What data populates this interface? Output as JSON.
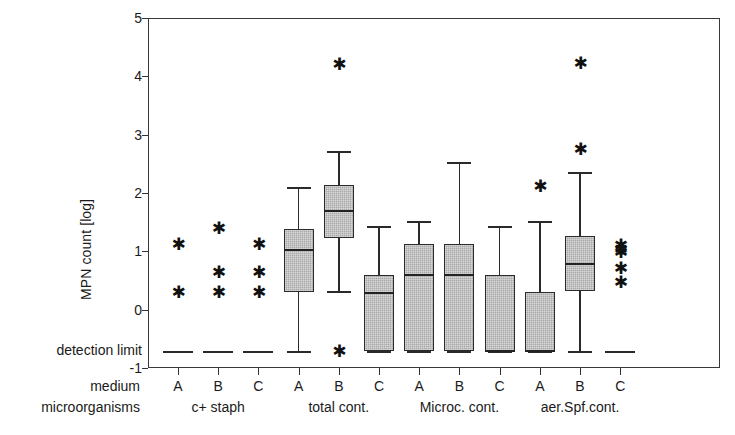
{
  "chart_data": {
    "type": "box",
    "title": "",
    "xlabel": "",
    "ylabel": "MPN count [log]",
    "ylim": [
      -1,
      5
    ],
    "yticks": [
      -1,
      0,
      1,
      2,
      3,
      4,
      5
    ],
    "ytick_labels": [
      "-1",
      "0",
      "1",
      "2",
      "3",
      "4",
      "5"
    ],
    "grid": false,
    "legend": "none",
    "detection_limit": {
      "label": "detection limit",
      "value": -0.71
    },
    "axis_row_labels": {
      "medium": "medium",
      "microorganisms": "microorganisms"
    },
    "groups": [
      {
        "label": "c+ staph",
        "media": [
          "A",
          "B",
          "C"
        ]
      },
      {
        "label": "total cont.",
        "media": [
          "A",
          "B",
          "C"
        ]
      },
      {
        "label": "Microc. cont.",
        "media": [
          "A",
          "B",
          "C"
        ]
      },
      {
        "label": "aer.Spf.cont.",
        "media": [
          "A",
          "B",
          "C"
        ]
      }
    ],
    "categories": [
      "c+ staph A",
      "c+ staph B",
      "c+ staph C",
      "total cont. A",
      "total cont. B",
      "total cont. C",
      "Microc. cont. A",
      "Microc. cont. B",
      "Microc. cont. C",
      "aer.Spf.cont. A",
      "aer.Spf.cont. B",
      "aer.Spf.cont. C"
    ],
    "boxes": [
      {
        "category": "c+ staph A",
        "group": "c+ staph",
        "medium": "A",
        "q1": -0.71,
        "median": -0.71,
        "q3": -0.71,
        "whisker_low": -0.71,
        "whisker_high": -0.71,
        "at_detection_limit": true,
        "outliers": [
          1.12,
          0.3
        ]
      },
      {
        "category": "c+ staph B",
        "group": "c+ staph",
        "medium": "B",
        "q1": -0.71,
        "median": -0.71,
        "q3": -0.71,
        "whisker_low": -0.71,
        "whisker_high": -0.71,
        "at_detection_limit": true,
        "outliers": [
          1.39,
          0.63,
          0.29
        ]
      },
      {
        "category": "c+ staph C",
        "group": "c+ staph",
        "medium": "C",
        "q1": -0.71,
        "median": -0.71,
        "q3": -0.71,
        "whisker_low": -0.71,
        "whisker_high": -0.71,
        "at_detection_limit": true,
        "outliers": [
          1.12,
          0.63,
          0.29
        ]
      },
      {
        "category": "total cont. A",
        "group": "total cont.",
        "medium": "A",
        "q1": 0.31,
        "median": 1.03,
        "q3": 1.38,
        "whisker_low": -0.71,
        "whisker_high": 2.1,
        "at_detection_limit": false,
        "outliers": []
      },
      {
        "category": "total cont. B",
        "group": "total cont.",
        "medium": "B",
        "q1": 1.23,
        "median": 1.7,
        "q3": 2.13,
        "whisker_low": 0.32,
        "whisker_high": 2.72,
        "at_detection_limit": false,
        "outliers": [
          4.21,
          -0.71
        ]
      },
      {
        "category": "total cont. C",
        "group": "total cont.",
        "medium": "C",
        "q1": -0.71,
        "median": 0.28,
        "q3": 0.6,
        "whisker_low": -0.71,
        "whisker_high": 1.43,
        "at_detection_limit": false,
        "outliers": []
      },
      {
        "category": "Microc. cont. A",
        "group": "Microc. cont.",
        "medium": "A",
        "q1": -0.71,
        "median": 0.6,
        "q3": 1.12,
        "whisker_low": -0.71,
        "whisker_high": 1.52,
        "at_detection_limit": false,
        "outliers": []
      },
      {
        "category": "Microc. cont. B",
        "group": "Microc. cont.",
        "medium": "B",
        "q1": -0.71,
        "median": 0.6,
        "q3": 1.12,
        "whisker_low": -0.71,
        "whisker_high": 2.53,
        "at_detection_limit": false,
        "outliers": []
      },
      {
        "category": "Microc. cont. C",
        "group": "Microc. cont.",
        "medium": "C",
        "q1": -0.71,
        "median": -0.71,
        "q3": 0.6,
        "whisker_low": -0.71,
        "whisker_high": 1.43,
        "at_detection_limit": false,
        "outliers": []
      },
      {
        "category": "aer.Spf.cont. A",
        "group": "aer.Spf.cont.",
        "medium": "A",
        "q1": -0.71,
        "median": -0.71,
        "q3": 0.3,
        "whisker_low": -0.71,
        "whisker_high": 1.52,
        "at_detection_limit": false,
        "outliers": [
          2.11
        ]
      },
      {
        "category": "aer.Spf.cont. B",
        "group": "aer.Spf.cont.",
        "medium": "B",
        "q1": 0.32,
        "median": 0.78,
        "q3": 1.27,
        "whisker_low": -0.71,
        "whisker_high": 2.36,
        "at_detection_limit": false,
        "outliers": [
          4.22,
          2.75
        ]
      },
      {
        "category": "aer.Spf.cont. C",
        "group": "aer.Spf.cont.",
        "medium": "C",
        "q1": -0.71,
        "median": -0.71,
        "q3": -0.71,
        "whisker_low": -0.71,
        "whisker_high": -0.71,
        "at_detection_limit": true,
        "outliers": [
          1.1,
          1.04,
          0.98,
          0.7,
          0.47
        ]
      }
    ],
    "colors": {
      "box_fill": "#a9a9a9",
      "box_edge": "#2a2a2a",
      "median": "#222222",
      "axis": "#333333",
      "background": "#ffffff"
    }
  }
}
